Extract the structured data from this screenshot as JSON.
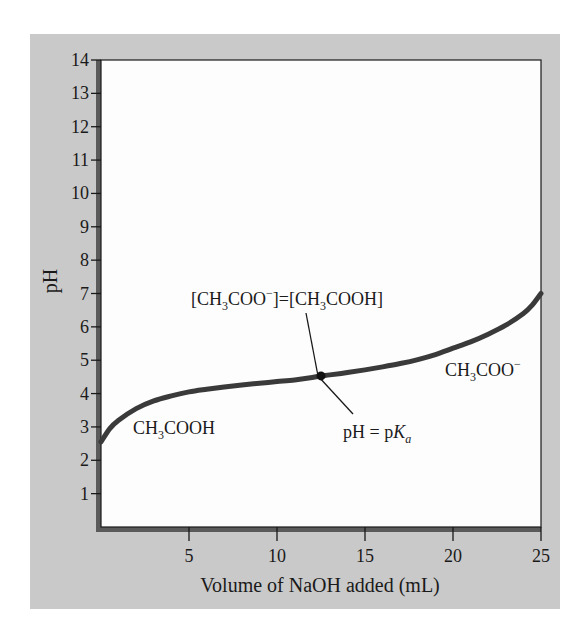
{
  "chart_data": {
    "type": "line",
    "title": "",
    "xlabel": "Volume of NaOH added (mL)",
    "ylabel": "pH",
    "xlim": [
      0,
      25
    ],
    "ylim": [
      0,
      14
    ],
    "grid": false,
    "legend": "none",
    "x_ticks": [
      5,
      10,
      15,
      20,
      25
    ],
    "y_ticks": [
      1,
      2,
      3,
      4,
      5,
      6,
      7,
      8,
      9,
      10,
      11,
      12,
      13,
      14
    ],
    "series": [
      {
        "name": "Titration curve of CH3COOH with NaOH",
        "x": [
          0,
          0.5,
          1,
          2,
          3,
          4,
          5,
          6,
          7,
          8,
          9,
          10,
          11,
          12,
          12.5,
          13,
          14,
          15,
          16,
          17,
          18,
          19,
          20,
          21,
          22,
          23,
          24,
          24.5,
          25
        ],
        "y": [
          2.55,
          2.95,
          3.2,
          3.55,
          3.78,
          3.93,
          4.05,
          4.13,
          4.2,
          4.26,
          4.31,
          4.36,
          4.41,
          4.48,
          4.53,
          4.56,
          4.63,
          4.71,
          4.8,
          4.9,
          5.02,
          5.17,
          5.36,
          5.55,
          5.78,
          6.05,
          6.4,
          6.65,
          7.0
        ]
      }
    ],
    "marker": {
      "x": 12.5,
      "y": 4.53,
      "label": "half-equivalence point"
    },
    "annotations": [
      {
        "text": "[CH3COO−]=[CH3COOH]",
        "points_to": [
          12.5,
          4.53
        ]
      },
      {
        "text": "pH = pKa",
        "points_to": [
          12.5,
          4.53
        ]
      },
      {
        "text": "CH3COOH",
        "region": "low volume"
      },
      {
        "text": "CH3COO−",
        "region": "high volume"
      }
    ]
  },
  "labels": {
    "ylabel": "pH",
    "xlabel": "Volume of NaOH added (mL)",
    "acid": {
      "main": "CH",
      "sub": "3",
      "rest": "COOH"
    },
    "base": {
      "main": "CH",
      "sub": "3",
      "rest": "COO",
      "sup": "−"
    },
    "equality": {
      "open1": "[CH",
      "sub1": "3",
      "mid1": "COO",
      "sup1": "−",
      "close1": "]=[CH",
      "sub2": "3",
      "mid2": "COOH]"
    },
    "pka": {
      "left": "pH = p",
      "k": "K",
      "sub": "a"
    }
  },
  "colors": {
    "frame": "#c9c9c9",
    "plot_bg": "#fdfdfd",
    "axis_shadow": "#5a5a5a",
    "curve": "#3a3a3a",
    "text": "#1a1a1a"
  }
}
